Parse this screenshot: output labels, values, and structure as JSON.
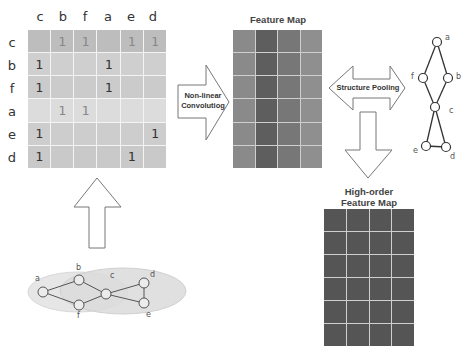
{
  "matrix": {
    "col_headers": [
      "c",
      "b",
      "f",
      "a",
      "e",
      "d"
    ],
    "row_headers": [
      "c",
      "b",
      "f",
      "a",
      "e",
      "d"
    ],
    "rows": [
      [
        "",
        "1",
        "1",
        "",
        "1",
        "1"
      ],
      [
        "1",
        "",
        "",
        "1",
        "",
        ""
      ],
      [
        "1",
        "",
        "",
        "1",
        "",
        ""
      ],
      [
        "",
        "1",
        "1",
        "",
        "",
        ""
      ],
      [
        "1",
        "",
        "",
        "",
        "",
        "1"
      ],
      [
        "1",
        "",
        "",
        "",
        "1",
        ""
      ]
    ],
    "row_colors": [
      "#bdbdbd",
      "#cfcfcf",
      "#cbcbcb",
      "#dcdcdc",
      "#cdcdcd",
      "#c9c9c9"
    ]
  },
  "arrows": {
    "convolution_label_line1": "Non-linear",
    "convolution_label_line2": "Convolutiog",
    "pooling_label": "Structure Pooling"
  },
  "feature_map": {
    "title": "Feature Map",
    "rows": 6,
    "cols": 4,
    "col_colors": [
      "#8a8a8a",
      "#5e5e5e",
      "#777777",
      "#8f8f8f"
    ]
  },
  "high_order_map": {
    "title_line1": "High-order",
    "title_line2": "Feature Map",
    "rows": 6,
    "cols": 4,
    "cell_color": "#555555"
  },
  "input_graph": {
    "nodes": [
      {
        "id": "a",
        "label": "a"
      },
      {
        "id": "b",
        "label": "b"
      },
      {
        "id": "f",
        "label": "f"
      },
      {
        "id": "c",
        "label": "c"
      },
      {
        "id": "d",
        "label": "d"
      },
      {
        "id": "e",
        "label": "e"
      }
    ],
    "edges": [
      [
        "a",
        "b"
      ],
      [
        "a",
        "f"
      ],
      [
        "b",
        "c"
      ],
      [
        "f",
        "c"
      ],
      [
        "c",
        "d"
      ],
      [
        "c",
        "e"
      ],
      [
        "d",
        "e"
      ]
    ]
  },
  "pooled_graph": {
    "nodes": [
      {
        "id": "a",
        "label": "a"
      },
      {
        "id": "f",
        "label": "f"
      },
      {
        "id": "b",
        "label": "b"
      },
      {
        "id": "c",
        "label": "c"
      },
      {
        "id": "e",
        "label": "e"
      },
      {
        "id": "d",
        "label": "d"
      }
    ],
    "edges": [
      [
        "a",
        "f"
      ],
      [
        "a",
        "b"
      ],
      [
        "f",
        "c"
      ],
      [
        "b",
        "c"
      ],
      [
        "c",
        "e"
      ],
      [
        "c",
        "d"
      ],
      [
        "e",
        "d"
      ]
    ]
  }
}
